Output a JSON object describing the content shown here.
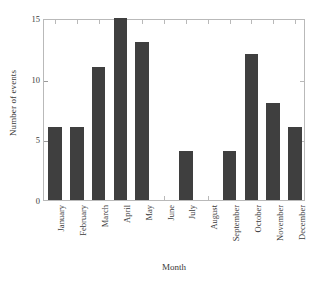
{
  "chart_data": {
    "type": "bar",
    "title": "",
    "xlabel": "Month",
    "ylabel": "Number of events",
    "categories": [
      "January",
      "February",
      "March",
      "April",
      "May",
      "June",
      "July",
      "August",
      "September",
      "October",
      "November",
      "December"
    ],
    "values": [
      6,
      6,
      11,
      15,
      13,
      0,
      4,
      0,
      4,
      12,
      8,
      6
    ],
    "ylim": [
      0,
      15
    ],
    "yticks": [
      0,
      5,
      10,
      15
    ],
    "ytick_labels": [
      "0",
      "5",
      "10",
      "15"
    ],
    "grid": false,
    "legend": null,
    "bar_color": "#3f3f3f",
    "axis_color": "#b9b9b9",
    "background_color": "#ffffff",
    "xtick_rotation": 90,
    "series": [
      {
        "name": "Number of events",
        "values": [
          6,
          6,
          11,
          15,
          13,
          0,
          4,
          0,
          4,
          12,
          8,
          6
        ]
      }
    ]
  }
}
